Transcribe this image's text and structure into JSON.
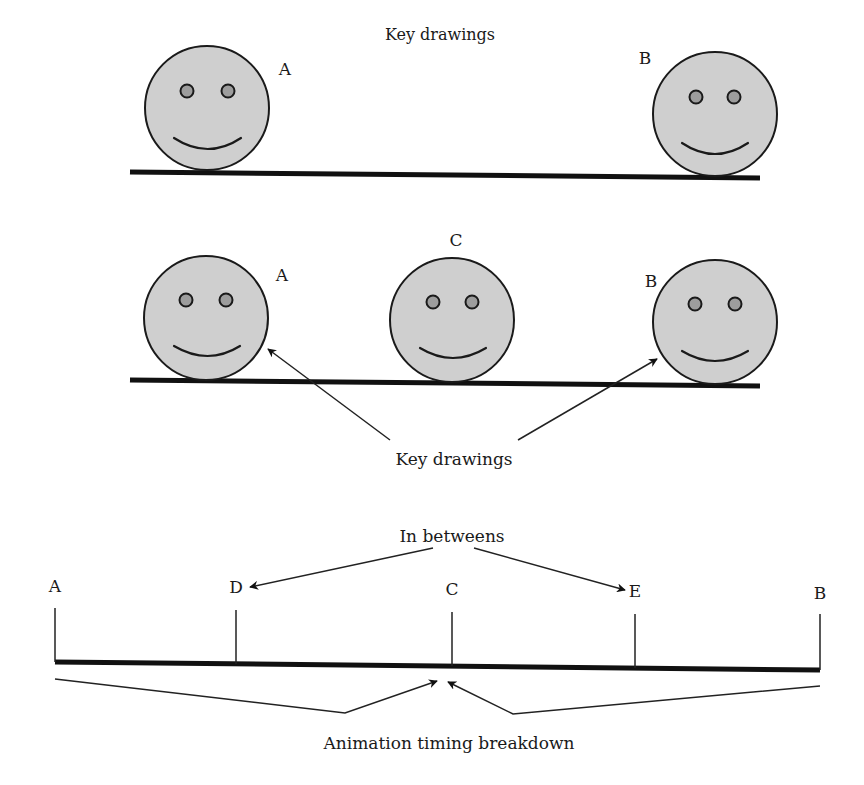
{
  "panel1": {
    "title": "Key drawings",
    "faces": [
      {
        "id": "face-a",
        "label": "A"
      },
      {
        "id": "face-b",
        "label": "B"
      }
    ]
  },
  "panel2": {
    "faces": [
      {
        "id": "face-a",
        "label": "A"
      },
      {
        "id": "face-c",
        "label": "C"
      },
      {
        "id": "face-b",
        "label": "B"
      }
    ],
    "callout": "Key drawings"
  },
  "panel3": {
    "top_callout": "In betweens",
    "bottom_callout": "Animation timing breakdown",
    "ticks": [
      {
        "label": "A",
        "position": 0.0
      },
      {
        "label": "D",
        "position": 0.25
      },
      {
        "label": "C",
        "position": 0.5
      },
      {
        "label": "E",
        "position": 0.75
      },
      {
        "label": "B",
        "position": 1.0
      }
    ]
  },
  "colors": {
    "face_fill": "#cfcfcf",
    "eye_fill": "#9d9d9d",
    "ink": "#1a1a1a"
  }
}
